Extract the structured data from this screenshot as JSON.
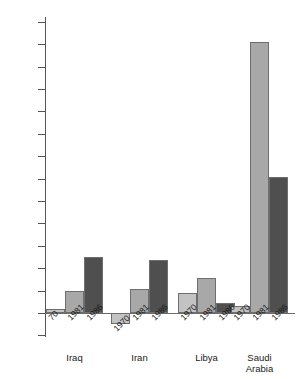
{
  "chart_data": {
    "type": "bar",
    "title": "",
    "subtitle": "",
    "xlabel": "",
    "ylabel": "Billions of U.S. dollars",
    "ylim": [
      -1,
      13
    ],
    "ytick_step": 1,
    "grid": false,
    "legend": "none",
    "categories": [
      "Iraq",
      "Iran",
      "Libya",
      "Saudi Arabia"
    ],
    "series": [
      {
        "name": "1970",
        "color": "#c3c3c3",
        "values": [
          0.2,
          -0.5,
          0.9,
          0.3
        ]
      },
      {
        "name": "1981",
        "color": "#a8a8a8",
        "values": [
          1.0,
          1.05,
          1.55,
          12.1
        ]
      },
      {
        "name": "1986",
        "color": "#4f4f4f",
        "values": [
          2.5,
          2.35,
          0.45,
          6.05
        ]
      }
    ],
    "ytick_labels": [
      "13",
      "12",
      "11",
      "10",
      "9",
      "8",
      "7",
      "6",
      "5",
      "4",
      "3",
      "2",
      "1",
      "0",
      "-1"
    ],
    "ytick_values": [
      13,
      12,
      11,
      10,
      9,
      8,
      7,
      6,
      5,
      4,
      3,
      2,
      1,
      0,
      -1
    ]
  },
  "axis": {
    "y_title": "Billions of U.S. dollars"
  },
  "groups": [
    {
      "name": "Iraq",
      "label": "Iraq",
      "bars": [
        {
          "year_label": "70",
          "year": "1970",
          "value": 0.2,
          "color": "#c3c3c3"
        },
        {
          "year_label": "1981",
          "year": "1981",
          "value": 1.0,
          "color": "#a8a8a8"
        },
        {
          "year_label": "1986",
          "year": "1986",
          "value": 2.5,
          "color": "#4f4f4f"
        }
      ]
    },
    {
      "name": "Iran",
      "label": "Iran",
      "bars": [
        {
          "year_label": "1970",
          "year": "1970",
          "value": -0.5,
          "color": "#c3c3c3"
        },
        {
          "year_label": "1981",
          "year": "1981",
          "value": 1.05,
          "color": "#a8a8a8"
        },
        {
          "year_label": "1986",
          "year": "1986",
          "value": 2.35,
          "color": "#4f4f4f"
        }
      ]
    },
    {
      "name": "Libya",
      "label": "Libya",
      "bars": [
        {
          "year_label": "1970",
          "year": "1970",
          "value": 0.9,
          "color": "#c3c3c3"
        },
        {
          "year_label": "1981",
          "year": "1981",
          "value": 1.55,
          "color": "#a8a8a8"
        },
        {
          "year_label": "1986",
          "year": "1986",
          "value": 0.45,
          "color": "#4f4f4f"
        }
      ]
    },
    {
      "name": "Saudi Arabia",
      "label": "Saudi\nArabia",
      "bars": [
        {
          "year_label": "1970",
          "year": "1970",
          "value": 0.3,
          "color": "#c3c3c3"
        },
        {
          "year_label": "1981",
          "year": "1981",
          "value": 12.1,
          "color": "#a8a8a8"
        },
        {
          "year_label": "1986",
          "year": "1986",
          "value": 6.05,
          "color": "#4f4f4f"
        }
      ]
    }
  ]
}
